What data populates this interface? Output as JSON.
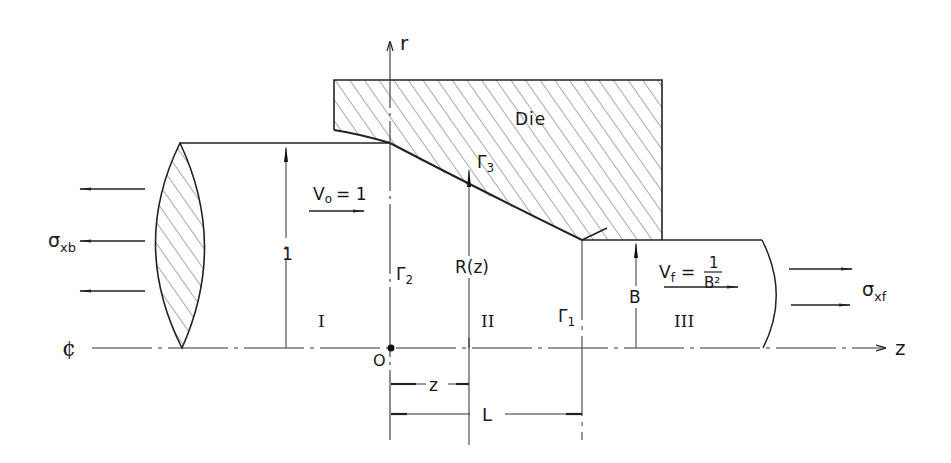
{
  "diagram": {
    "type": "extrusion-die-schematic",
    "axes": {
      "r_axis_label": "r",
      "z_axis_label": "z",
      "centerline_label": "¢",
      "origin_label": "O"
    },
    "die": {
      "label": "Die"
    },
    "regions": [
      {
        "id": "I",
        "label": "I"
      },
      {
        "id": "II",
        "label": "II"
      },
      {
        "id": "III",
        "label": "III"
      }
    ],
    "boundaries": {
      "gamma1": {
        "symbol": "Γ",
        "sub": "1"
      },
      "gamma2": {
        "symbol": "Γ",
        "sub": "2"
      },
      "gamma3": {
        "symbol": "Γ",
        "sub": "3"
      }
    },
    "dimensions": {
      "entry_radius": "1",
      "die_radius": "R(z)",
      "exit_radius": "B",
      "z_distance": "z",
      "die_length": "L"
    },
    "velocities": {
      "entry": {
        "lhs": "V",
        "sub": "o",
        "rhs": "= 1"
      },
      "exit": {
        "lhs": "V",
        "sub": "f",
        "eq": "=",
        "num": "1",
        "den": "B²"
      }
    },
    "stresses": {
      "back": {
        "symbol": "σ",
        "sub": "xb"
      },
      "front": {
        "symbol": "σ",
        "sub": "xf"
      }
    }
  }
}
